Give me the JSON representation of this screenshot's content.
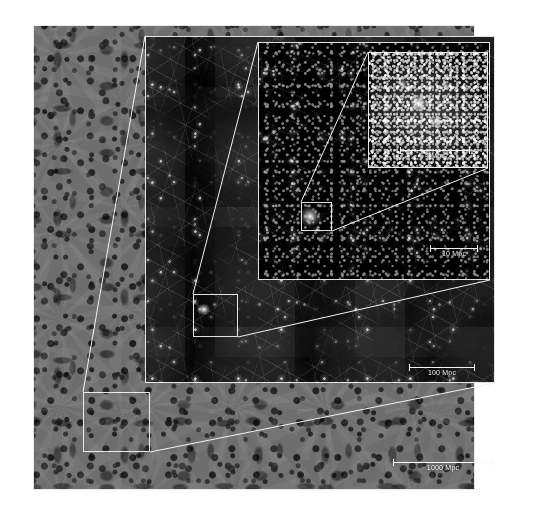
{
  "figure": {
    "name": "cosmological-simulation-zoom-sequence",
    "background_color": "#ffffff"
  },
  "panels": [
    {
      "id": "outer",
      "name": "full-simulation-volume",
      "tone": "gray",
      "background_color": "#6e6e6e",
      "scale_label": "1000 Mpc"
    },
    {
      "id": "large",
      "name": "large-scale-structure",
      "tone": "dark",
      "background_color": "#050505",
      "scale_label": "100 Mpc"
    },
    {
      "id": "middle",
      "name": "filament-region",
      "tone": "dark",
      "background_color": "#030303",
      "scale_label": "10 Mpc"
    },
    {
      "id": "inner",
      "name": "galaxy-cluster-closeup",
      "tone": "dark",
      "background_color": "#000000",
      "scale_label": "4 Mpc"
    }
  ],
  "scalebars": [
    {
      "id": "sb-1000",
      "label": "1000 Mpc",
      "value": 1000,
      "unit": "Mpc",
      "panel": "outer"
    },
    {
      "id": "sb-100",
      "label": "100 Mpc",
      "value": 100,
      "unit": "Mpc",
      "panel": "large"
    },
    {
      "id": "sb-10",
      "label": "10 Mpc",
      "value": 10,
      "unit": "Mpc",
      "panel": "middle"
    },
    {
      "id": "sb-4",
      "label": "4 Mpc",
      "value": 4,
      "unit": "Mpc",
      "panel": "inner"
    }
  ],
  "zoom_boxes": [
    {
      "id": "zb-outer",
      "name": "zoom-region-outer",
      "in_panel": "outer",
      "points_to": "large"
    },
    {
      "id": "zb-large",
      "name": "zoom-region-large",
      "in_panel": "large",
      "points_to": "middle"
    },
    {
      "id": "zb-middle",
      "name": "zoom-region-middle",
      "in_panel": "middle",
      "points_to": "inner"
    }
  ],
  "colors": {
    "line": "#f5f5f5",
    "gray_field": "#6e6e6e",
    "dark_field": "#050505",
    "label_text": "#f0f0f0"
  }
}
